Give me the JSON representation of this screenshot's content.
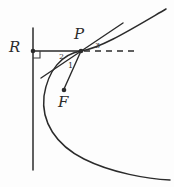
{
  "figure": {
    "kind": "parabola-focus-directrix-tangent-diagram",
    "width": 174,
    "height": 187,
    "background_color": "#fdfdfd",
    "ink_color": "#2b2b2b",
    "labels": {
      "directrix_foot": "R",
      "point_on_curve": "P",
      "focus": "F",
      "angle_one": "1",
      "angle_two": "2",
      "angle_three": "3"
    },
    "points": {
      "R": {
        "x": 33,
        "y": 51
      },
      "P": {
        "x": 81,
        "y": 51
      },
      "F": {
        "x": 64,
        "y": 90
      }
    },
    "elements": {
      "directrix_label": "vertical directrix line",
      "segment_RP_label": "horizontal segment R to P",
      "dashed_ray_label": "dashed horizontal ray right of P",
      "tangent_label": "tangent line at P",
      "segment_PF_label": "segment P to F",
      "curve_label": "parabola opening right",
      "right_angle_label": "right angle mark at R"
    },
    "geometry": {
      "directrix_x": 33,
      "directrix_y_top": 28,
      "directrix_y_bottom": 170,
      "dashed_ray_end_x": 136,
      "tangent_start": {
        "x": 41,
        "y": 78
      },
      "tangent_end": {
        "x": 123,
        "y": 23
      },
      "parabola_vertex": {
        "x": 44,
        "y": 96
      },
      "parabola_top_end": {
        "x": 166,
        "y": 9
      },
      "parabola_bottom_end": {
        "x": 170,
        "y": 180
      },
      "right_angle_size": 7
    }
  }
}
